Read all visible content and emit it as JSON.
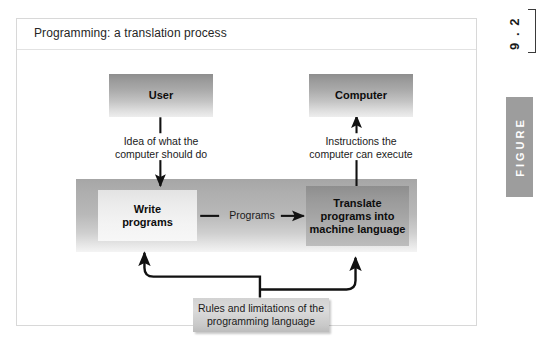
{
  "figure": {
    "title": "Programming: a translation process",
    "number": "9 . 2",
    "word": "FIGURE"
  },
  "diagram": {
    "type": "flowchart",
    "nodes": [
      {
        "id": "user",
        "label": "User"
      },
      {
        "id": "computer",
        "label": "Computer"
      },
      {
        "id": "write",
        "label": "Write\nprograms"
      },
      {
        "id": "translate",
        "label": "Translate\nprograms into\nmachine language"
      },
      {
        "id": "rules",
        "label": "Rules and limitations of the\nprogramming language"
      }
    ],
    "edges": [
      {
        "from": "user",
        "to": "write",
        "label": "Idea of what the\ncomputer should do"
      },
      {
        "from": "write",
        "to": "translate",
        "label": "Programs"
      },
      {
        "from": "translate",
        "to": "computer",
        "label": "Instructions the\ncomputer can execute"
      },
      {
        "from": "rules",
        "to": "write",
        "label": ""
      },
      {
        "from": "rules",
        "to": "translate",
        "label": ""
      }
    ]
  },
  "colors": {
    "frame_border": "#d8d8d8",
    "band_gray": "#b8b8b8",
    "node_dark": "#9a9a9a",
    "node_light": "#eeeeee",
    "figure_tab": "#9d9d9d",
    "arrow": "#111111"
  }
}
